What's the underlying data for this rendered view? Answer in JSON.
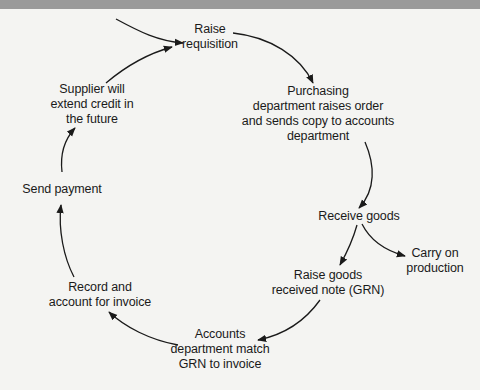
{
  "diagram": {
    "type": "cycle",
    "title": "",
    "colors": {
      "background": "#f4f4f2",
      "top_strip": "#9a9a9a",
      "text": "#1a1a1a",
      "arrow": "#1a1a1a"
    },
    "nodes": [
      {
        "id": "raise-requisition",
        "lines": [
          "Raise",
          "requisition"
        ]
      },
      {
        "id": "purchasing-raises-order",
        "lines": [
          "Purchasing",
          "department raises order",
          "and sends copy to accounts",
          "department"
        ]
      },
      {
        "id": "receive-goods",
        "lines": [
          "Receive goods"
        ]
      },
      {
        "id": "carry-on-production",
        "lines": [
          "Carry on",
          "production"
        ]
      },
      {
        "id": "raise-grn",
        "lines": [
          "Raise goods",
          "received note (GRN)"
        ]
      },
      {
        "id": "accounts-match-grn",
        "lines": [
          "Accounts",
          "department match",
          "GRN to invoice"
        ]
      },
      {
        "id": "record-invoice",
        "lines": [
          "Record and",
          "account for invoice"
        ]
      },
      {
        "id": "send-payment",
        "lines": [
          "Send payment"
        ]
      },
      {
        "id": "supplier-extend-credit",
        "lines": [
          "Supplier will",
          "extend credit in",
          "the future"
        ]
      }
    ],
    "edges": [
      {
        "from": "external-entry",
        "to": "raise-requisition"
      },
      {
        "from": "raise-requisition",
        "to": "purchasing-raises-order"
      },
      {
        "from": "purchasing-raises-order",
        "to": "receive-goods"
      },
      {
        "from": "receive-goods",
        "to": "carry-on-production"
      },
      {
        "from": "receive-goods",
        "to": "raise-grn"
      },
      {
        "from": "raise-grn",
        "to": "accounts-match-grn"
      },
      {
        "from": "accounts-match-grn",
        "to": "record-invoice"
      },
      {
        "from": "record-invoice",
        "to": "send-payment"
      },
      {
        "from": "send-payment",
        "to": "supplier-extend-credit"
      },
      {
        "from": "supplier-extend-credit",
        "to": "raise-requisition"
      }
    ]
  }
}
